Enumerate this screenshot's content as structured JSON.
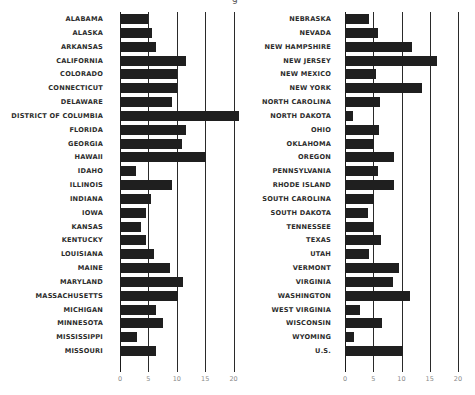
{
  "title_fragment": "g",
  "chart_data": [
    {
      "type": "bar",
      "orientation": "horizontal",
      "title": "",
      "xlabel": "",
      "ylabel": "",
      "xlim": [
        0,
        20
      ],
      "xticks": [
        "0",
        "5",
        "10",
        "15",
        "20"
      ],
      "grid": true,
      "categories": [
        "ALABAMA",
        "ALASKA",
        "ARKANSAS",
        "CALIFORNIA",
        "COLORADO",
        "CONNECTICUT",
        "DELAWARE",
        "DISTRICT OF COLUMBIA",
        "FLORIDA",
        "GEORGIA",
        "HAWAII",
        "IDAHO",
        "ILLINOIS",
        "INDIANA",
        "IOWA",
        "KANSAS",
        "KENTUCKY",
        "LOUISIANA",
        "MAINE",
        "MARYLAND",
        "MASSACHUSETTS",
        "MICHIGAN",
        "MINNESOTA",
        "MISSISSIPPI",
        "MISSOURI"
      ],
      "values": [
        4.9,
        5.6,
        6.3,
        11.7,
        10.0,
        10.0,
        9.1,
        20.9,
        11.7,
        10.9,
        15.1,
        2.8,
        9.1,
        5.4,
        4.6,
        3.7,
        4.6,
        6.0,
        8.8,
        11.1,
        10.2,
        6.3,
        7.5,
        3.0,
        6.3
      ]
    },
    {
      "type": "bar",
      "orientation": "horizontal",
      "title": "",
      "xlabel": "",
      "ylabel": "",
      "xlim": [
        0,
        20
      ],
      "xticks": [
        "0",
        "5",
        "10",
        "15",
        "20"
      ],
      "grid": true,
      "categories": [
        "NEBRASKA",
        "NEVADA",
        "NEW HAMPSHIRE",
        "NEW JERSEY",
        "NEW MEXICO",
        "NEW YORK",
        "NORTH CAROLINA",
        "NORTH DAKOTA",
        "OHIO",
        "OKLAHOMA",
        "OREGON",
        "PENNSYLVANIA",
        "RHODE ISLAND",
        "SOUTH CAROLINA",
        "SOUTH DAKOTA",
        "TENNESSEE",
        "TEXAS",
        "UTAH",
        "VERMONT",
        "VIRGINIA",
        "WASHINGTON",
        "WEST VIRGINIA",
        "WISCONSIN",
        "WYOMING",
        "U.S."
      ],
      "values": [
        4.2,
        5.8,
        11.8,
        16.3,
        5.5,
        13.6,
        6.2,
        1.4,
        6.0,
        5.1,
        8.7,
        5.8,
        8.7,
        5.1,
        4.1,
        5.1,
        6.4,
        4.2,
        9.6,
        8.5,
        11.5,
        2.7,
        6.5,
        1.6,
        10.3
      ]
    }
  ],
  "colors": {
    "bar": "#1f1f1f",
    "grid": "#2a2a2a",
    "label": "#2b2b2b",
    "tick": "#8a8a8a"
  }
}
